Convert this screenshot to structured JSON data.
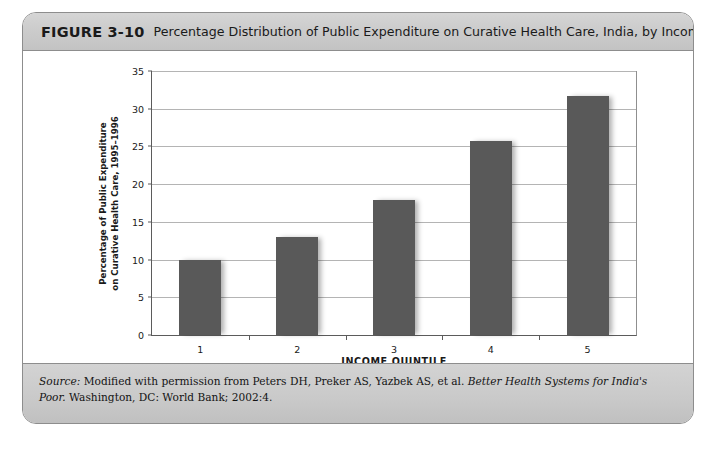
{
  "figure": {
    "number": "FIGURE 3-10",
    "title": "Percentage Distribution of Public Expenditure on Curative Health Care, India, by Income Quintile"
  },
  "source": {
    "label": "Source:",
    "text_before": " Modified with permission from Peters DH, Preker AS, Yazbek AS, et al. ",
    "work_title": "Better Health Systems for India's Poor.",
    "text_after": " Washington, DC: World Bank; 2002:4."
  },
  "chart_data": {
    "type": "bar",
    "title": "Percentage Distribution of Public Expenditure on Curative Health Care, India, by Income Quintile",
    "categories": [
      "1",
      "2",
      "3",
      "4",
      "5"
    ],
    "category_sublabels": [
      "(Poorest)",
      "",
      "",
      "",
      "(Richest)"
    ],
    "values": [
      10.0,
      13.0,
      17.9,
      25.7,
      31.7
    ],
    "xlabel": "INCOME QUINTILE",
    "ylabel_line1": "Percentage of Public Expenditure",
    "ylabel_line2": "on Curative Health Care, 1995–1996",
    "ylim": [
      0,
      35
    ],
    "ytick_labels": [
      "0",
      "5",
      "10",
      "15",
      "20",
      "25",
      "30",
      "35"
    ],
    "ytick_values": [
      0,
      5,
      10,
      15,
      20,
      25,
      30,
      35
    ],
    "grid": true,
    "legend": "none",
    "bar_color": "#595959",
    "gridline_color": "#b4b4b4",
    "axis_color": "#5b5b5b"
  }
}
